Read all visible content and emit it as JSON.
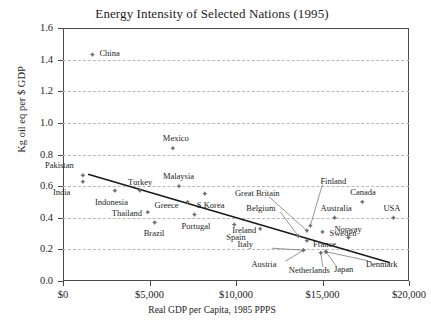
{
  "chart_data": {
    "type": "scatter",
    "title": "Energy Intensity of Selected Nations (1995)",
    "xlabel": "Real GDP per Capita, 1985 PPPS",
    "ylabel": "Kg oil eq per $ GDP",
    "xlim": [
      0,
      20000
    ],
    "ylim": [
      0.0,
      1.6
    ],
    "grid": true,
    "legend": "none",
    "xticks": [
      "$0",
      "$5,000",
      "$10,000",
      "$15,000",
      "$20,000"
    ],
    "xtick_values": [
      0,
      5000,
      10000,
      15000,
      20000
    ],
    "yticks": [
      "0.0",
      "0.2",
      "0.4",
      "0.6",
      "0.8",
      "1.0",
      "1.2",
      "1.4",
      "1.6"
    ],
    "ytick_values": [
      0.0,
      0.2,
      0.4,
      0.6,
      0.8,
      1.0,
      1.2,
      1.4,
      1.6
    ],
    "marker": "diamond",
    "marker_color": "#6d6d72",
    "trendline": {
      "x": [
        1450,
        18900
      ],
      "y": [
        0.675,
        0.115
      ],
      "color": "#1a1a1a"
    },
    "points": [
      {
        "name": "China",
        "x": 1700,
        "y": 1.432,
        "label_dx": 7,
        "label_dy": -2
      },
      {
        "name": "Mexico",
        "x": 6350,
        "y": 0.84,
        "label_dx": -10,
        "label_dy": -10
      },
      {
        "name": "Pakistan",
        "x": 1150,
        "y": 0.668,
        "label_dx": -38,
        "label_dy": -10
      },
      {
        "name": "India",
        "x": 1150,
        "y": 0.628,
        "label_dx": -30,
        "label_dy": 10
      },
      {
        "name": "Indonesia",
        "x": 3000,
        "y": 0.572,
        "label_dx": -20,
        "label_dy": 11
      },
      {
        "name": "Turkey",
        "x": 4450,
        "y": 0.572,
        "label_dx": -12,
        "label_dy": -9
      },
      {
        "name": "Malaysia",
        "x": 6700,
        "y": 0.6,
        "label_dx": -16,
        "label_dy": -10
      },
      {
        "name": "Thailand",
        "x": 4900,
        "y": 0.435,
        "label_dx": -36,
        "label_dy": 1
      },
      {
        "name": "Greece",
        "x": 7200,
        "y": 0.5,
        "label_dx": -33,
        "label_dy": 3
      },
      {
        "name": "S.Korea",
        "x": 8200,
        "y": 0.552,
        "label_dx": -8,
        "label_dy": 11
      },
      {
        "name": "Brazil",
        "x": 5300,
        "y": 0.37,
        "label_dx": -11,
        "label_dy": 11
      },
      {
        "name": "Portugal",
        "x": 7600,
        "y": 0.42,
        "label_dx": -13,
        "label_dy": 11
      },
      {
        "name": "Spain",
        "x": 9900,
        "y": 0.357,
        "label_dx": -8,
        "label_dy": 12
      },
      {
        "name": "Ireland",
        "x": 11400,
        "y": 0.33,
        "label_dx": -28,
        "label_dy": 1
      },
      {
        "name": "Great Britain",
        "x": 14100,
        "y": 0.318,
        "label_dx": -72,
        "label_dy": -38,
        "leader": true
      },
      {
        "name": "Belgium",
        "x": 13600,
        "y": 0.285,
        "label_dx": -52,
        "label_dy": -28,
        "leader": true
      },
      {
        "name": "Finland",
        "x": 14300,
        "y": 0.35,
        "label_dx": 10,
        "label_dy": -45,
        "leader": true
      },
      {
        "name": "Sweden",
        "x": 15000,
        "y": 0.31,
        "label_dx": 7,
        "label_dy": 1
      },
      {
        "name": "France",
        "x": 14100,
        "y": 0.255,
        "label_dx": 6,
        "label_dy": 3
      },
      {
        "name": "Australia",
        "x": 15700,
        "y": 0.4,
        "label_dx": -14,
        "label_dy": -10
      },
      {
        "name": "Canada",
        "x": 17300,
        "y": 0.5,
        "label_dx": -12,
        "label_dy": -10
      },
      {
        "name": "USA",
        "x": 19100,
        "y": 0.4,
        "label_dx": -10,
        "label_dy": -10
      },
      {
        "name": "Norway",
        "x": 16500,
        "y": 0.275,
        "label_dx": -14,
        "label_dy": -9
      },
      {
        "name": "Italy",
        "x": 13900,
        "y": 0.195,
        "label_dx": -66,
        "label_dy": -6,
        "leader": true
      },
      {
        "name": "Austria",
        "x": 13900,
        "y": 0.195,
        "label_dx": -52,
        "label_dy": 14,
        "leader": true
      },
      {
        "name": "Netherlands",
        "x": 14900,
        "y": 0.178,
        "label_dx": -32,
        "label_dy": 17,
        "leader": true
      },
      {
        "name": "Japan",
        "x": 15200,
        "y": 0.185,
        "label_dx": 8,
        "label_dy": 17,
        "leader": true
      },
      {
        "name": "Denmark",
        "x": 15200,
        "y": 0.185,
        "label_dx": 40,
        "label_dy": 12,
        "leader": true
      }
    ]
  }
}
